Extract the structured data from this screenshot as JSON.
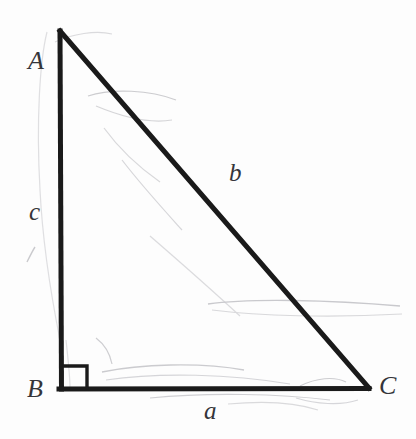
{
  "figure": {
    "kind": "right-triangle-diagram",
    "background_color": "#fdfdfd",
    "stroke_color": "#1a1a1a",
    "label_color": "#35353a",
    "faint_stroke_color": "#bfbfc2"
  },
  "vertices": {
    "A": {
      "label": "A",
      "x": 60,
      "y": 30
    },
    "B": {
      "label": "B",
      "x": 61,
      "y": 389
    },
    "C": {
      "label": "C",
      "x": 368,
      "y": 389
    }
  },
  "sides": {
    "a": {
      "label": "a",
      "between": "B-C",
      "role": "opposite-A"
    },
    "b": {
      "label": "b",
      "between": "A-C",
      "role": "hypotenuse"
    },
    "c": {
      "label": "c",
      "between": "A-B",
      "role": "opposite-C"
    }
  },
  "right_angle": {
    "at": "B",
    "marker": "square",
    "x": 63,
    "y": 365,
    "size": 25
  }
}
